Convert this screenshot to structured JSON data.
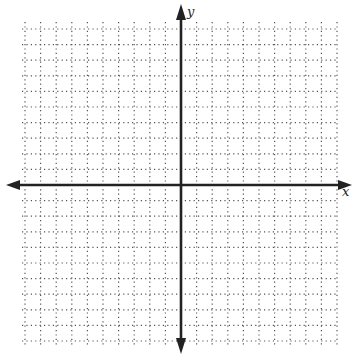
{
  "chart_data": {
    "type": "scatter",
    "title": "",
    "xlabel": "x",
    "ylabel": "y",
    "xlim": [
      -10.5,
      10.5
    ],
    "ylim": [
      -10.5,
      10.5
    ],
    "grid": true,
    "grid_style": "dotted",
    "x_ticks": [
      -10,
      -9,
      -8,
      -7,
      -6,
      -5,
      -4,
      -3,
      -2,
      -1,
      0,
      1,
      2,
      3,
      4,
      5,
      6,
      7,
      8,
      9,
      10
    ],
    "y_ticks": [
      -10,
      -9,
      -8,
      -7,
      -6,
      -5,
      -4,
      -3,
      -2,
      -1,
      0,
      1,
      2,
      3,
      4,
      5,
      6,
      7,
      8,
      9,
      10
    ],
    "tick_labels_shown": false,
    "series": [],
    "legend": null
  },
  "axes": {
    "x_label": "x",
    "y_label": "y",
    "color": "#222222",
    "grid_color": "#555555"
  }
}
